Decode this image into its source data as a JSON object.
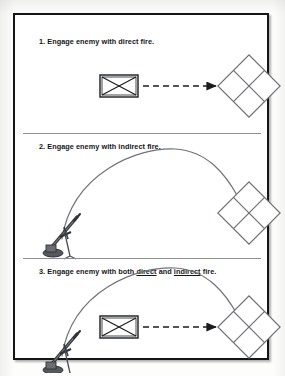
{
  "document": {
    "title": "Engaging the enemy — direct, indirect and combined fire",
    "type": "tactical-diagram",
    "page_background": "#ffffff",
    "ink_color": "#1b1c20",
    "panel_divider_color": "#8d8f93"
  },
  "panels": [
    {
      "id": "panel-1",
      "number": "1.",
      "caption": "1. Engage enemy with direct fire.",
      "caption_parts": [
        {
          "text": "1. Engage enemy with direct fire.",
          "underline": false
        }
      ],
      "elements": {
        "friendly_unit": {
          "symbol_name": "infantry-unit-symbol",
          "description": "rectangle with crossed diagonals (infantry)"
        },
        "enemy_unit": {
          "symbol_name": "enemy-diamond-symbol",
          "description": "diamond divided into four quadrants"
        },
        "fire": {
          "symbol_name": "direct-fire-arrow",
          "style": "dashed straight arrow",
          "description": "dashed line with solid arrowhead pointing at enemy"
        }
      }
    },
    {
      "id": "panel-2",
      "number": "2.",
      "caption": "2. Engage enemy with indirect fire.",
      "caption_parts": [
        {
          "text": "2. Engage enemy with indirect fire.",
          "underline": false
        }
      ],
      "elements": {
        "friendly_unit": {
          "symbol_name": "mortar-icon",
          "description": "mortar tube on bipod with baseplate"
        },
        "enemy_unit": {
          "symbol_name": "enemy-diamond-symbol",
          "description": "diamond divided into four quadrants"
        },
        "fire": {
          "symbol_name": "indirect-fire-arc",
          "style": "solid parabolic arc",
          "description": "high-angle ballistic trajectory from mortar to enemy"
        }
      }
    },
    {
      "id": "panel-3",
      "number": "3.",
      "caption": "3. Engage enemy with both direct and indirect fire.",
      "caption_parts": [
        {
          "text": "3. Engage enemy with both ",
          "underline": false
        },
        {
          "text": "direct",
          "underline": true
        },
        {
          "text": " and ",
          "underline": false
        },
        {
          "text": "indirect",
          "underline": true
        },
        {
          "text": " fire.",
          "underline": false
        }
      ],
      "elements": {
        "friendly_unit_direct": {
          "symbol_name": "infantry-unit-symbol",
          "description": "rectangle with crossed diagonals (infantry)"
        },
        "friendly_unit_indirect": {
          "symbol_name": "mortar-icon",
          "description": "mortar tube on bipod with baseplate"
        },
        "enemy_unit": {
          "symbol_name": "enemy-diamond-symbol",
          "description": "diamond divided into four quadrants"
        },
        "fire_direct": {
          "symbol_name": "direct-fire-arrow",
          "style": "dashed straight arrow"
        },
        "fire_indirect": {
          "symbol_name": "indirect-fire-arc",
          "style": "solid parabolic arc"
        }
      }
    }
  ]
}
